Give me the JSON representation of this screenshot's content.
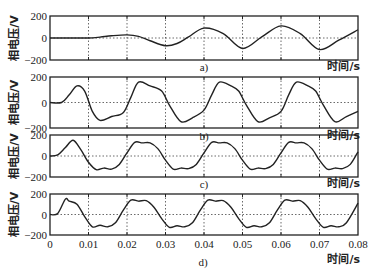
{
  "chart_data": [
    {
      "type": "line",
      "panel_label": "a)",
      "ylabel": "相电压/V",
      "xlabel": "时间/s",
      "xlim": [
        0,
        0.08
      ],
      "ylim": [
        -200,
        200
      ],
      "yticks": [
        "200",
        "0",
        "-200"
      ],
      "xticks": [],
      "grid": true,
      "x": [
        0,
        0.005,
        0.01,
        0.013,
        0.016,
        0.02,
        0.023,
        0.026,
        0.03,
        0.033,
        0.036,
        0.04,
        0.045,
        0.05,
        0.055,
        0.06,
        0.065,
        0.07,
        0.075,
        0.08
      ],
      "y": [
        0,
        0,
        0,
        8,
        20,
        28,
        15,
        -25,
        -70,
        -50,
        10,
        90,
        40,
        -95,
        10,
        110,
        40,
        -105,
        -20,
        75
      ]
    },
    {
      "type": "line",
      "panel_label": "b)",
      "ylabel": "相电压/V",
      "xlabel": "时间/s",
      "xlim": [
        0,
        0.08
      ],
      "ylim": [
        -200,
        200
      ],
      "yticks": [
        "200",
        "0",
        "-200"
      ],
      "xticks": [],
      "grid": true,
      "x": [
        0,
        0.003,
        0.005,
        0.007,
        0.009,
        0.011,
        0.013,
        0.016,
        0.019,
        0.021,
        0.023,
        0.026,
        0.029,
        0.031,
        0.034,
        0.037,
        0.04,
        0.042,
        0.044,
        0.047,
        0.049,
        0.051,
        0.054,
        0.057,
        0.06,
        0.062,
        0.064,
        0.067,
        0.069,
        0.071,
        0.074,
        0.077,
        0.08
      ],
      "y": [
        0,
        0,
        60,
        130,
        90,
        -70,
        -140,
        -110,
        -80,
        40,
        160,
        130,
        90,
        -20,
        -150,
        -120,
        -60,
        60,
        160,
        130,
        90,
        -20,
        -150,
        -120,
        -70,
        60,
        160,
        130,
        90,
        -20,
        -150,
        -110,
        -70
      ]
    },
    {
      "type": "line",
      "panel_label": "c)",
      "ylabel": "相电压/V",
      "xlabel": "时间/s",
      "xlim": [
        0,
        0.08
      ],
      "ylim": [
        -200,
        200
      ],
      "yticks": [
        "200",
        "0",
        "-200"
      ],
      "xticks": [],
      "grid": true,
      "x": [
        0,
        0.002,
        0.004,
        0.006,
        0.008,
        0.01,
        0.012,
        0.014,
        0.016,
        0.018,
        0.02,
        0.022,
        0.024,
        0.026,
        0.028,
        0.03,
        0.032,
        0.034,
        0.036,
        0.038,
        0.04,
        0.042,
        0.044,
        0.046,
        0.048,
        0.05,
        0.052,
        0.054,
        0.056,
        0.058,
        0.06,
        0.062,
        0.064,
        0.066,
        0.068,
        0.07,
        0.072,
        0.074,
        0.076,
        0.078,
        0.08
      ],
      "y": [
        0,
        10,
        80,
        150,
        60,
        -60,
        -130,
        -115,
        -125,
        -80,
        30,
        130,
        125,
        125,
        70,
        -40,
        -125,
        -115,
        -120,
        -80,
        30,
        130,
        125,
        125,
        70,
        -40,
        -125,
        -115,
        -120,
        -80,
        30,
        130,
        125,
        125,
        70,
        -40,
        -125,
        -115,
        -120,
        -80,
        40
      ]
    },
    {
      "type": "line",
      "panel_label": "d)",
      "ylabel": "相电压/V",
      "xlabel": "时间/s",
      "xlim": [
        0,
        0.08
      ],
      "ylim": [
        -200,
        200
      ],
      "yticks": [
        "200",
        "0",
        "-200"
      ],
      "xticks": [
        "0",
        "0.01",
        "0.02",
        "0.03",
        "0.04",
        "0.05",
        "0.06",
        "0.07",
        "0.08"
      ],
      "grid": true,
      "x": [
        0,
        0.002,
        0.004,
        0.005,
        0.007,
        0.009,
        0.011,
        0.013,
        0.015,
        0.017,
        0.019,
        0.021,
        0.023,
        0.025,
        0.027,
        0.029,
        0.031,
        0.033,
        0.035,
        0.037,
        0.039,
        0.041,
        0.043,
        0.045,
        0.047,
        0.049,
        0.051,
        0.053,
        0.055,
        0.057,
        0.059,
        0.061,
        0.063,
        0.065,
        0.067,
        0.069,
        0.071,
        0.073,
        0.075,
        0.077,
        0.08
      ],
      "y": [
        0,
        10,
        150,
        130,
        100,
        -20,
        -120,
        -105,
        -120,
        -80,
        40,
        140,
        130,
        135,
        70,
        -40,
        -125,
        -110,
        -120,
        -80,
        40,
        140,
        130,
        135,
        70,
        -40,
        -125,
        -110,
        -120,
        -80,
        40,
        140,
        130,
        135,
        70,
        -40,
        -125,
        -110,
        -120,
        -80,
        110
      ]
    }
  ]
}
